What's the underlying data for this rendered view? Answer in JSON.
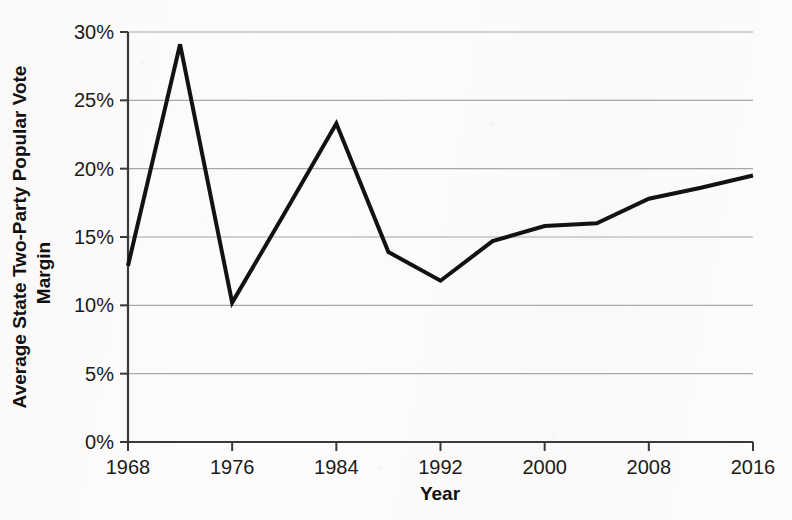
{
  "chart_data": {
    "type": "line",
    "title": "",
    "subtitle": "",
    "xlabel": "Year",
    "ylabel": "Average State Two-Party Popular Vote Margin",
    "ylabel_lines": [
      "Average State Two-Party Popular Vote",
      "Margin"
    ],
    "grid": true,
    "legend": false,
    "legend_position": "none",
    "xlim": [
      1968,
      2016
    ],
    "ylim": [
      0,
      30
    ],
    "x_tick_labels": [
      "1968",
      "1976",
      "1984",
      "1992",
      "2000",
      "2008",
      "2016"
    ],
    "x_tick_values": [
      1968,
      1976,
      1984,
      1992,
      2000,
      2008,
      2016
    ],
    "y_tick_labels": [
      "0%",
      "5%",
      "10%",
      "15%",
      "20%",
      "25%",
      "30%"
    ],
    "y_tick_values": [
      0,
      5,
      10,
      15,
      20,
      25,
      30
    ],
    "y_unit": "%",
    "x": [
      1968,
      1972,
      1976,
      1980,
      1984,
      1988,
      1992,
      1996,
      2000,
      2004,
      2008,
      2012,
      2016
    ],
    "values": [
      12.9,
      29.1,
      10.2,
      16.7,
      23.3,
      13.9,
      11.8,
      14.7,
      15.8,
      16.0,
      17.8,
      18.6,
      19.5
    ],
    "series": [
      {
        "name": "Average State Two-Party Popular Vote Margin",
        "values": [
          12.9,
          29.1,
          10.2,
          16.7,
          23.3,
          13.9,
          11.8,
          14.7,
          15.8,
          16.0,
          17.8,
          18.6,
          19.5
        ]
      }
    ],
    "colors": {
      "line": "#121212",
      "grid": "#a8a8a8",
      "axis": "#3a3a3a",
      "text": "#1a1a1a",
      "background": "#fdfcfa"
    },
    "line_width": 4
  }
}
